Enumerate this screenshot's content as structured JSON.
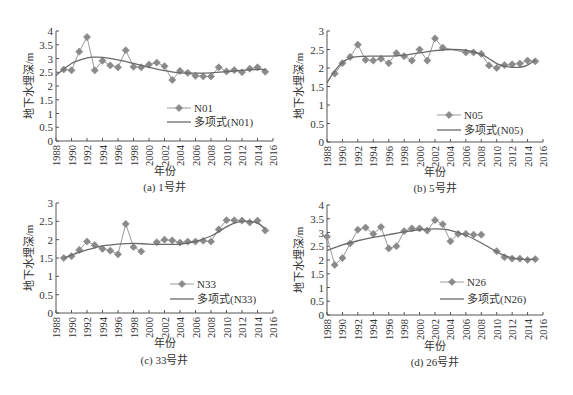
{
  "figure": {
    "panels_count": 4
  },
  "chart_data": [
    {
      "type": "line",
      "panel_id": "a",
      "caption": "(a) 1号井",
      "xlabel": "年份",
      "ylabel": "地下水埋深/m",
      "xlim": [
        1988,
        2016
      ],
      "ylim": [
        0,
        4
      ],
      "yticks": [
        0,
        0.5,
        1,
        1.5,
        2,
        2.5,
        3,
        3.5,
        4
      ],
      "xticks": [
        1988,
        1990,
        1992,
        1994,
        1996,
        1998,
        2000,
        2002,
        2004,
        2006,
        2008,
        2010,
        2012,
        2014,
        2016
      ],
      "grid": false,
      "legend": {
        "position": "inside-lower-center",
        "entries": [
          "N01",
          "多项式(N01)"
        ]
      },
      "series": [
        {
          "name": "N01",
          "style": "line-diamond",
          "x": [
            1989,
            1990,
            1991,
            1992,
            1993,
            1994,
            1995,
            1996,
            1997,
            1998,
            1999,
            2000,
            2001,
            2002,
            2003,
            2004,
            2005,
            2006,
            2007,
            2008,
            2009,
            2010,
            2011,
            2012,
            2013,
            2014,
            2015
          ],
          "values": [
            2.6,
            2.57,
            3.25,
            3.78,
            2.57,
            2.92,
            2.75,
            2.68,
            3.3,
            2.7,
            2.68,
            2.78,
            2.85,
            2.72,
            2.22,
            2.55,
            2.48,
            2.37,
            2.35,
            2.35,
            2.68,
            2.53,
            2.58,
            2.5,
            2.63,
            2.68,
            2.52
          ]
        },
        {
          "name": "多项式(N01)",
          "style": "smooth-line",
          "x": [
            1988,
            1990,
            1992,
            1993,
            1994,
            1996,
            1998,
            2000,
            2002,
            2004,
            2006,
            2008,
            2010,
            2012,
            2014,
            2015
          ],
          "values": [
            2.38,
            2.82,
            3.02,
            3.05,
            3.04,
            2.95,
            2.82,
            2.68,
            2.56,
            2.48,
            2.47,
            2.48,
            2.52,
            2.57,
            2.6,
            2.6
          ]
        }
      ]
    },
    {
      "type": "line",
      "panel_id": "b",
      "caption": "(b) 5号井",
      "xlabel": "年份",
      "ylabel": "地下水埋深/m",
      "xlim": [
        1988,
        2016
      ],
      "ylim": [
        0,
        3
      ],
      "yticks": [
        0,
        0.5,
        1,
        1.5,
        2,
        2.5,
        3
      ],
      "xticks": [
        1988,
        1990,
        1992,
        1994,
        1996,
        1998,
        2000,
        2002,
        2004,
        2006,
        2008,
        2010,
        2012,
        2014,
        2016
      ],
      "grid": false,
      "legend": {
        "position": "inside-lower-center",
        "entries": [
          "N05",
          "多项式(N05)"
        ]
      },
      "series": [
        {
          "name": "N05",
          "style": "line-diamond",
          "x": [
            1989,
            1990,
            1991,
            1992,
            1993,
            1994,
            1995,
            1996,
            1997,
            1998,
            1999,
            2000,
            2001,
            2002,
            2003,
            2006,
            2007,
            2008,
            2009,
            2010,
            2011,
            2012,
            2013,
            2014,
            2015
          ],
          "values": [
            1.85,
            2.13,
            2.3,
            2.63,
            2.22,
            2.2,
            2.25,
            2.13,
            2.4,
            2.32,
            2.2,
            2.5,
            2.2,
            2.8,
            2.55,
            2.42,
            2.42,
            2.38,
            2.07,
            2.0,
            2.08,
            2.1,
            2.12,
            2.2,
            2.18
          ]
        },
        {
          "name": "多项式(N05)",
          "style": "smooth-line",
          "x": [
            1988,
            1989,
            1990,
            1991,
            1992,
            1994,
            1996,
            1998,
            2000,
            2002,
            2004,
            2006,
            2008,
            2009,
            2010,
            2011,
            2012,
            2013,
            2014,
            2015
          ],
          "values": [
            1.6,
            1.92,
            2.15,
            2.27,
            2.31,
            2.32,
            2.32,
            2.35,
            2.41,
            2.47,
            2.5,
            2.48,
            2.37,
            2.25,
            2.12,
            2.05,
            2.02,
            2.02,
            2.08,
            2.22
          ]
        }
      ]
    },
    {
      "type": "line",
      "panel_id": "c",
      "caption": "(c) 33号井",
      "xlabel": "年份",
      "ylabel": "地下水埋深/m",
      "xlim": [
        1988,
        2016
      ],
      "ylim": [
        0,
        3
      ],
      "yticks": [
        0,
        0.5,
        1,
        1.5,
        2,
        2.5,
        3
      ],
      "xticks": [
        1988,
        1990,
        1992,
        1994,
        1996,
        1998,
        2000,
        2002,
        2004,
        2006,
        2008,
        2010,
        2012,
        2014,
        2016
      ],
      "grid": false,
      "legend": {
        "position": "inside-lower-center",
        "entries": [
          "N33",
          "多项式(N33)"
        ]
      },
      "series": [
        {
          "name": "N33",
          "style": "line-diamond",
          "segments": [
            {
              "x": [
                1989,
                1990,
                1991,
                1992,
                1993,
                1994,
                1995,
                1996,
                1997,
                1998,
                1999
              ],
              "values": [
                1.5,
                1.55,
                1.72,
                1.95,
                1.85,
                1.75,
                1.7,
                1.6,
                2.43,
                1.8,
                1.68
              ]
            },
            {
              "x": [
                2001,
                2002,
                2003,
                2004,
                2005,
                2006,
                2007,
                2008,
                2009,
                2010,
                2011,
                2012,
                2013,
                2014,
                2015
              ],
              "values": [
                1.93,
                2.0,
                1.98,
                1.92,
                1.95,
                1.95,
                1.97,
                1.95,
                2.28,
                2.53,
                2.53,
                2.52,
                2.47,
                2.52,
                2.25
              ]
            }
          ]
        },
        {
          "name": "多项式(N33)",
          "style": "smooth-line",
          "x": [
            1989,
            1990,
            1992,
            1994,
            1996,
            1998,
            2000,
            2002,
            2004,
            2006,
            2008,
            2009,
            2010,
            2011,
            2012,
            2013,
            2014,
            2015
          ],
          "values": [
            1.5,
            1.58,
            1.72,
            1.83,
            1.88,
            1.9,
            1.88,
            1.87,
            1.88,
            1.95,
            2.1,
            2.22,
            2.35,
            2.45,
            2.5,
            2.5,
            2.45,
            2.3
          ]
        }
      ]
    },
    {
      "type": "line",
      "panel_id": "d",
      "caption": "(d) 26号井",
      "xlabel": "年份",
      "ylabel": "地下水埋深/m",
      "xlim": [
        1988,
        2016
      ],
      "ylim": [
        0,
        4
      ],
      "yticks": [
        0,
        0.5,
        1,
        1.5,
        2,
        2.5,
        3,
        3.5,
        4
      ],
      "xticks": [
        1988,
        1990,
        1992,
        1994,
        1996,
        1998,
        2000,
        2002,
        2004,
        2006,
        2008,
        2010,
        2012,
        2014,
        2016
      ],
      "grid": false,
      "legend": {
        "position": "inside-lower-center",
        "entries": [
          "N26",
          "多项式(N26)"
        ]
      },
      "series": [
        {
          "name": "N26",
          "style": "line-diamond",
          "segments": [
            {
              "x": [
                1988,
                1989,
                1990,
                1991,
                1992,
                1993,
                1994,
                1995,
                1996,
                1997,
                1998,
                1999,
                2000,
                2001,
                2002,
                2003,
                2004,
                2005,
                2006,
                2007,
                2008
              ],
              "values": [
                2.85,
                1.82,
                2.07,
                2.6,
                3.1,
                3.18,
                2.95,
                3.2,
                2.42,
                2.5,
                3.05,
                3.15,
                3.15,
                3.07,
                3.45,
                3.3,
                2.68,
                2.95,
                2.95,
                2.92,
                2.92
              ]
            },
            {
              "x": [
                2010,
                2011,
                2012,
                2013,
                2014,
                2015
              ],
              "values": [
                2.32,
                2.1,
                2.05,
                2.05,
                2.0,
                2.03
              ]
            }
          ]
        },
        {
          "name": "多项式(N26)",
          "style": "smooth-line",
          "x": [
            1988,
            1990,
            1992,
            1994,
            1996,
            1998,
            2000,
            2002,
            2003,
            2004,
            2006,
            2008,
            2010,
            2011,
            2012,
            2013,
            2014,
            2015
          ],
          "values": [
            2.35,
            2.55,
            2.7,
            2.82,
            2.92,
            3.02,
            3.1,
            3.13,
            3.12,
            3.08,
            2.9,
            2.62,
            2.3,
            2.17,
            2.08,
            2.03,
            2.02,
            2.04
          ]
        }
      ]
    }
  ],
  "layout": [
    {
      "x0": 56,
      "x1": 273,
      "ytop": 31,
      "ybot": 141,
      "legend_x": 167,
      "legend_y1": 108,
      "legend_y2": 122,
      "ylabel_x": 33,
      "ylabel_cy": 86,
      "xlabel_y": 175,
      "caption_y": 191
    },
    {
      "x0": 327,
      "x1": 543,
      "ytop": 31,
      "ybot": 142,
      "legend_x": 437,
      "legend_y1": 115,
      "legend_y2": 130,
      "ylabel_x": 303,
      "ylabel_cy": 86,
      "xlabel_y": 176,
      "caption_y": 192
    },
    {
      "x0": 56,
      "x1": 273,
      "ytop": 203,
      "ybot": 313,
      "legend_x": 170,
      "legend_y1": 284,
      "legend_y2": 299,
      "ylabel_x": 33,
      "ylabel_cy": 258,
      "xlabel_y": 347,
      "caption_y": 364
    },
    {
      "x0": 327,
      "x1": 543,
      "ytop": 205,
      "ybot": 315,
      "legend_x": 440,
      "legend_y1": 282,
      "legend_y2": 299,
      "ylabel_x": 303,
      "ylabel_cy": 260,
      "xlabel_y": 350,
      "caption_y": 366
    }
  ],
  "colors": {
    "axis": "#555555",
    "data_line": "#9a9a9a",
    "marker": "#8a8a8a",
    "trend_line": "#6a6a6a",
    "text": "#333333"
  }
}
